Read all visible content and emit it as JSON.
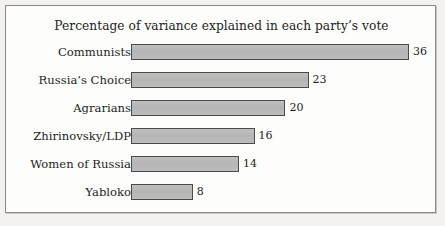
{
  "chart_data": {
    "type": "bar",
    "orientation": "horizontal",
    "title": "Percentage of variance explained in each party’s vote",
    "xlabel": "",
    "ylabel": "",
    "categories": [
      "Communists",
      "Russia’s Choice",
      "Agrarians",
      "Zhirinovsky/LDP",
      "Women of Russia",
      "Yabloko"
    ],
    "values": [
      36,
      23,
      20,
      16,
      14,
      8
    ],
    "value_labels": [
      "36",
      "23",
      "20",
      "16",
      "14",
      "8"
    ],
    "xlim": [
      0,
      36
    ],
    "grid": false,
    "legend": null,
    "bar_color": "#b9b9b9",
    "bar_border_color": "#4a4a4a",
    "frame_border_color": "#8a8a86",
    "background_color": "#fdfdfb"
  },
  "frame": {
    "title": "Percentage of variance explained in each party’s vote"
  },
  "rows": [
    {
      "label": "Communists",
      "value": 36,
      "value_label": "36"
    },
    {
      "label": "Russia’s Choice",
      "value": 23,
      "value_label": "23"
    },
    {
      "label": "Agrarians",
      "value": 20,
      "value_label": "20"
    },
    {
      "label": "Zhirinovsky/LDP",
      "value": 16,
      "value_label": "16"
    },
    {
      "label": "Women of Russia",
      "value": 14,
      "value_label": "14"
    },
    {
      "label": "Yabloko",
      "value": 8,
      "value_label": "8"
    }
  ]
}
